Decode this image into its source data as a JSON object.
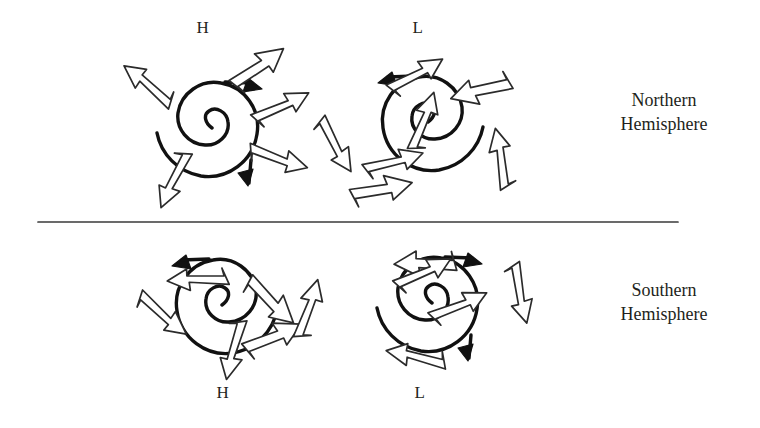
{
  "figure": {
    "type": "diagram",
    "background_color": "#ffffff",
    "ink_color": "#111111",
    "arrow_fill": "#ffffff",
    "arrow_stroke": "#2b2b2b"
  },
  "equator": {
    "name": "equator-divider",
    "x1": 38,
    "x2": 678,
    "y": 222,
    "color": "#3a3a3a"
  },
  "hemispheres": [
    {
      "id": "northern",
      "line1": "Northern",
      "line2": "Hemisphere",
      "label_x": 664,
      "label_y": 113
    },
    {
      "id": "southern",
      "line1": "Southern",
      "line2": "Hemisphere",
      "label_x": 664,
      "label_y": 303
    }
  ],
  "systems": [
    {
      "id": "northern-high",
      "label": "H",
      "pressure": "high",
      "hemisphere": "northern",
      "label_x": 203,
      "label_y": 18,
      "label_position": "above",
      "center_x": 212,
      "center_y": 128,
      "radius": 52,
      "spiral_rotation": "clockwise-inward",
      "flow": "outward",
      "arrow_count": 6
    },
    {
      "id": "northern-low",
      "label": "L",
      "pressure": "low",
      "hemisphere": "northern",
      "label_x": 418,
      "label_y": 18,
      "label_position": "above",
      "center_x": 428,
      "center_y": 122,
      "radius": 52,
      "spiral_rotation": "counterclockwise-inward",
      "flow": "inward",
      "arrow_count": 6
    },
    {
      "id": "southern-high",
      "label": "H",
      "pressure": "high",
      "hemisphere": "southern",
      "label_x": 223,
      "label_y": 383,
      "label_position": "below",
      "center_x": 222,
      "center_y": 305,
      "radius": 52,
      "spiral_rotation": "counterclockwise-inward",
      "flow": "outward",
      "arrow_count": 6
    },
    {
      "id": "southern-low",
      "label": "L",
      "pressure": "low",
      "hemisphere": "southern",
      "label_x": 420,
      "label_y": 383,
      "label_position": "below",
      "center_x": 432,
      "center_y": 303,
      "radius": 50,
      "spiral_rotation": "clockwise-inward",
      "flow": "inward",
      "arrow_count": 5
    }
  ]
}
